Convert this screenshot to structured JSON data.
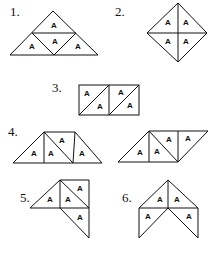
{
  "figures": [
    {
      "label": "1.",
      "cell_letter": "A"
    },
    {
      "label": "2.",
      "cell_letter": "A"
    },
    {
      "label": "3.",
      "cell_letter": "A"
    },
    {
      "label": "4.",
      "cell_letter": "A"
    },
    {
      "label": "5.",
      "cell_letter": "A"
    },
    {
      "label": "6.",
      "cell_letter": "A"
    }
  ]
}
